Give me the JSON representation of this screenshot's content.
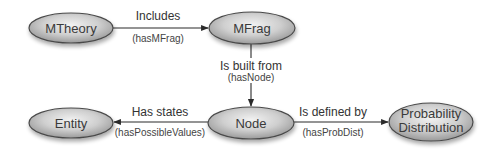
{
  "diagram": {
    "type": "ontology-relationship-diagram",
    "colors": {
      "node_fill_light": "#f0f0f0",
      "node_fill_dark": "#a8a8a8",
      "node_stroke": "#4a4a4a",
      "edge": "#2a2a2a",
      "text": "#3a3a3a",
      "background": "#ffffff"
    },
    "nodes": [
      {
        "id": "mtheory",
        "label": "MTheory"
      },
      {
        "id": "mfrag",
        "label": "MFrag"
      },
      {
        "id": "entity",
        "label": "Entity"
      },
      {
        "id": "node",
        "label": "Node"
      },
      {
        "id": "probdist",
        "label_line1": "Probability",
        "label_line2": "Distribution"
      }
    ],
    "edges": [
      {
        "from": "mtheory",
        "to": "mfrag",
        "label": "Includes",
        "property": "(hasMFrag)"
      },
      {
        "from": "mfrag",
        "to": "node",
        "label": "Is built from",
        "property": "(hasNode)"
      },
      {
        "from": "node",
        "to": "entity",
        "label": "Has states",
        "property": "(hasPossibleValues)"
      },
      {
        "from": "node",
        "to": "probdist",
        "label": "Is defined by",
        "property": "(hasProbDist)"
      }
    ]
  }
}
